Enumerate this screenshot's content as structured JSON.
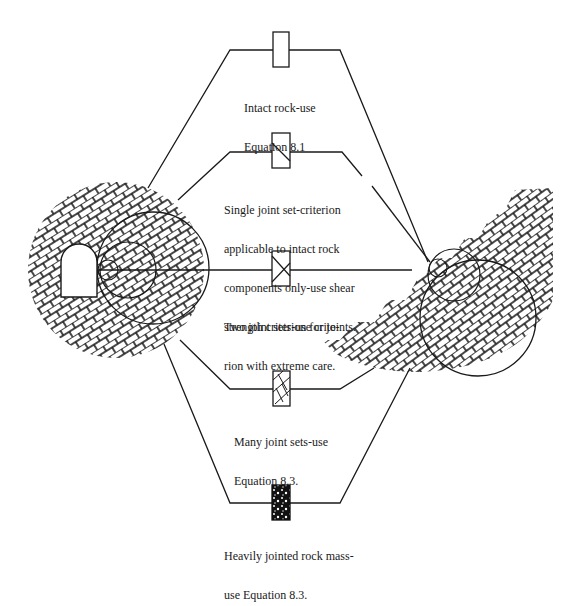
{
  "diagram": {
    "type": "rock-mass-classification-schematic",
    "colors": {
      "ink": "#1a1a1a",
      "background": "#ffffff"
    },
    "left_feature": "tunnel-in-jointed-rock",
    "right_feature": "stepped-slope-in-jointed-rock",
    "categories": [
      {
        "id": "intact",
        "symbol": "blank-box-icon",
        "lines": [
          "Intact rock-use",
          "Equation 8.1"
        ]
      },
      {
        "id": "single-joint",
        "symbol": "single-diagonal-box-icon",
        "lines": [
          "Single joint set-criterion",
          "applicable to intact rock",
          "components only-use shear",
          "strength criterion for joints."
        ]
      },
      {
        "id": "two-joints",
        "symbol": "cross-diagonal-box-icon",
        "lines": [
          "Two joint sets-use crite-",
          "rion with extreme care."
        ]
      },
      {
        "id": "many-joints",
        "symbol": "multi-joint-box-icon",
        "lines": [
          "Many joint sets-use",
          "Equation 8.3."
        ]
      },
      {
        "id": "heavily-jointed",
        "symbol": "dense-fragmented-box-icon",
        "lines": [
          "Heavily jointed rock mass-",
          "use Equation 8.3."
        ]
      }
    ]
  }
}
